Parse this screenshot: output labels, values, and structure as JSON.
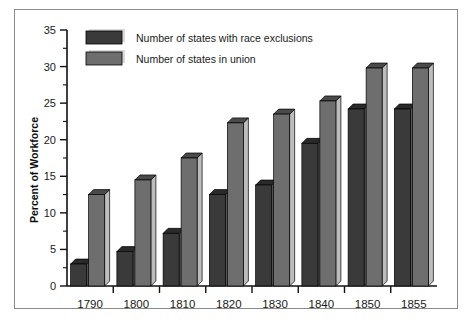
{
  "chart_data": {
    "type": "bar",
    "title": "",
    "subtitle": "",
    "xlabel": "",
    "ylabel": "Percent of Workforce",
    "categories": [
      "1790",
      "1800",
      "1810",
      "1820",
      "1830",
      "1840",
      "1850",
      "1855"
    ],
    "series": [
      {
        "name": "Number of states with race exclusions",
        "color": "#3a3a3a",
        "side_color": "#585858",
        "top_color": "#2a2a2a",
        "values": [
          3.0,
          4.7,
          7.2,
          12.5,
          13.8,
          19.5,
          24.2,
          24.2
        ]
      },
      {
        "name": "Number of states in union",
        "color": "#6e6e6e",
        "side_color": "#bdbdbd",
        "top_color": "#4a4a4a",
        "values": [
          12.5,
          14.5,
          17.5,
          22.3,
          23.5,
          25.3,
          29.8,
          29.8
        ]
      }
    ],
    "ylim": [
      0,
      35
    ],
    "ytick_labels": [
      "0",
      "5",
      "10",
      "15",
      "20",
      "25",
      "30",
      "35"
    ],
    "ytick_values": [
      0,
      5,
      10,
      15,
      20,
      25,
      30,
      35
    ],
    "yminor_values": [
      2.5,
      7.5,
      12.5,
      17.5,
      22.5,
      27.5,
      32.5
    ],
    "grid": false,
    "legend_position": "top-left",
    "style": "3d-bars",
    "background_color": "#ffffff",
    "frame_color": "#8a8a8a",
    "axis_color": "#111111"
  }
}
